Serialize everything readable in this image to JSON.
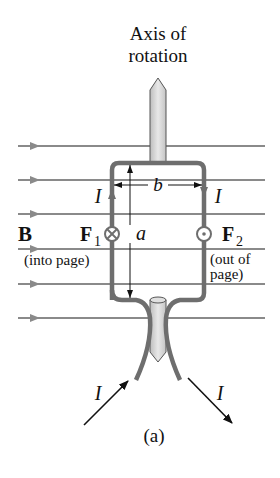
{
  "diagram": {
    "title_line1": "Axis of",
    "title_line2": "rotation",
    "field_label": "B",
    "force1_label": "F",
    "force1_sub": "1",
    "force1_note": "(into page)",
    "force2_label": "F",
    "force2_sub": "2",
    "force2_note_line1": "(out of",
    "force2_note_line2": "page)",
    "dim_width": "b",
    "dim_height": "a",
    "current_label": "I",
    "caption": "(a)",
    "field_lines_y": [
      146,
      180,
      214,
      249,
      284,
      318
    ],
    "colors": {
      "wire": "#6e6e6e",
      "field": "#8a8a8a",
      "shaft_fill": "#d9d9d9",
      "shaft_stroke": "#555555",
      "text": "#111111"
    }
  }
}
